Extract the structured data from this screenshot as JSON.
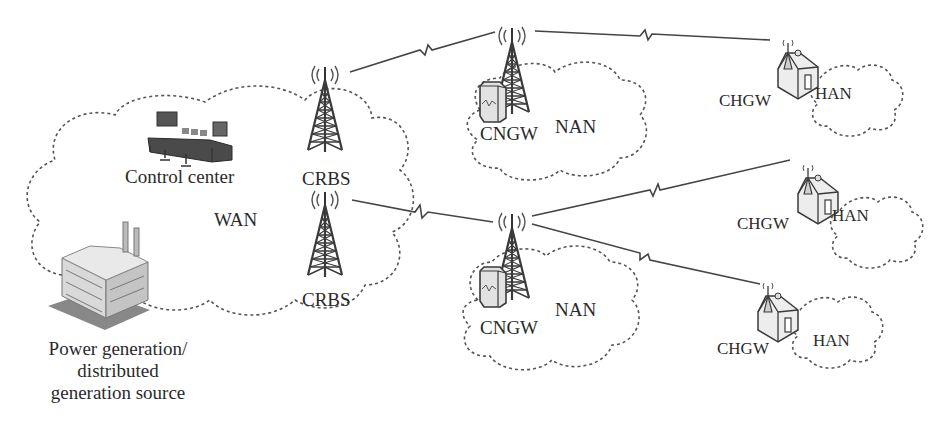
{
  "diagram": {
    "colors": {
      "ink": "#3a3a3a",
      "cloud": "#555555",
      "house_fill": "#e8e8e8",
      "gateway_fill": "#dedede",
      "background": "#ffffff"
    },
    "clouds": [
      {
        "id": "wan",
        "label": "WAN"
      },
      {
        "id": "nan-top",
        "label": "NAN"
      },
      {
        "id": "nan-bottom",
        "label": "NAN"
      },
      {
        "id": "han-1",
        "label": "HAN"
      },
      {
        "id": "han-2",
        "label": "HAN"
      },
      {
        "id": "han-3",
        "label": "HAN"
      }
    ],
    "nodes": {
      "control_center": {
        "label": "Control center",
        "icon": "control-console-icon"
      },
      "power_source": {
        "label_lines": [
          "Power generation/",
          "distributed",
          "generation source"
        ],
        "icon": "factory-icon"
      },
      "crbs_top": {
        "label": "CRBS",
        "icon": "cell-tower-icon"
      },
      "crbs_bottom": {
        "label": "CRBS",
        "icon": "cell-tower-icon"
      },
      "cngw_top": {
        "label": "CNGW",
        "icon": "gateway-cabinet-icon"
      },
      "cngw_bottom": {
        "label": "CNGW",
        "icon": "gateway-cabinet-icon"
      },
      "chgw_1": {
        "label": "CHGW",
        "icon": "house-gateway-icon"
      },
      "chgw_2": {
        "label": "CHGW",
        "icon": "house-gateway-icon"
      },
      "chgw_3": {
        "label": "CHGW",
        "icon": "house-gateway-icon"
      }
    },
    "links": [
      {
        "from": "crbs_top",
        "to": "cngw_top",
        "type": "wireless"
      },
      {
        "from": "cngw_top",
        "to": "chgw_1",
        "type": "wireless"
      },
      {
        "from": "crbs_bottom",
        "to": "cngw_bottom",
        "type": "wireless"
      },
      {
        "from": "cngw_bottom",
        "to": "chgw_2",
        "type": "wireless"
      },
      {
        "from": "cngw_bottom",
        "to": "chgw_3",
        "type": "wireless"
      }
    ]
  }
}
